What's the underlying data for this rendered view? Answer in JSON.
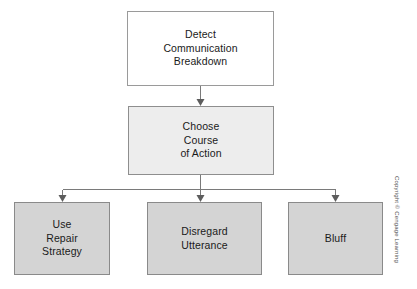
{
  "diagram": {
    "type": "flowchart",
    "orientation": "top-down",
    "levels": 3,
    "nodes": [
      {
        "id": "detect",
        "level": 1,
        "lines": [
          "Detect",
          "Communication",
          "Breakdown"
        ],
        "fill": "#ffffff",
        "border": "#9a9a9a"
      },
      {
        "id": "choose",
        "level": 2,
        "lines": [
          "Choose",
          "Course",
          "of Action"
        ],
        "fill": "#ededed",
        "border": "#8e8e8e"
      },
      {
        "id": "repair",
        "level": 3,
        "lines": [
          "Use",
          "Repair",
          "Strategy"
        ],
        "fill": "#d4d4d4",
        "border": "#8a8a8a"
      },
      {
        "id": "disregard",
        "level": 3,
        "lines": [
          "Disregard",
          "Utterance"
        ],
        "fill": "#d4d4d4",
        "border": "#8a8a8a"
      },
      {
        "id": "bluff",
        "level": 3,
        "lines": [
          "Bluff"
        ],
        "fill": "#d4d4d4",
        "border": "#8a8a8a"
      }
    ],
    "edges": [
      {
        "from": "detect",
        "to": "choose",
        "style": "arrow"
      },
      {
        "from": "choose",
        "to": "repair",
        "style": "arrow"
      },
      {
        "from": "choose",
        "to": "disregard",
        "style": "arrow"
      },
      {
        "from": "choose",
        "to": "bluff",
        "style": "arrow"
      }
    ],
    "line_color": "#7a7a7a"
  },
  "credit": {
    "text": "Copyright © Cengage Learning"
  }
}
